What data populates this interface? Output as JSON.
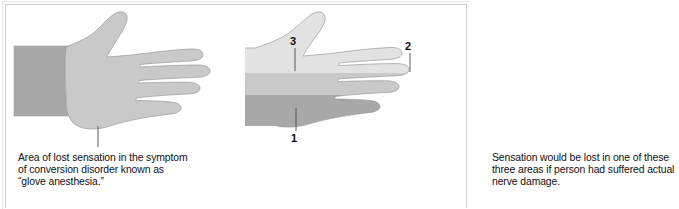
{
  "figure": {
    "background_color": "#ffffff",
    "frame_color": "#cfcfcf"
  },
  "palette": {
    "forearm_dark": "#a8a8a8",
    "hand_light": "#c9c9c9",
    "zone_light": "#e2e2e2",
    "zone_medium": "#c9c9c9",
    "zone_dark": "#a8a8a8",
    "outline": "#8e8e8e",
    "leader_line": "#4a4a4a",
    "text": "#111111"
  },
  "left_panel": {
    "name": "glove-anesthesia-diagram",
    "caption": "Area of lost sensation in the symptom\nof conversion disorder known as\n“glove anesthesia.”",
    "regions": [
      {
        "name": "forearm",
        "label": "forearm",
        "color": "#a8a8a8"
      },
      {
        "name": "glove-area",
        "label": "area of lost sensation",
        "color": "#c9c9c9"
      }
    ]
  },
  "right_panel": {
    "name": "nerve-damage-diagram",
    "caption": "Sensation would be lost in one of these\nthree areas if person had suffered actual\nnerve damage.",
    "zones": [
      {
        "id": "1",
        "label": "1",
        "name": "nerve-zone-1",
        "color": "#a8a8a8",
        "description": "lower forearm and lower fingers"
      },
      {
        "id": "2",
        "label": "2",
        "name": "nerve-zone-2",
        "color": "#c9c9c9",
        "description": "middle hand and upper fingers"
      },
      {
        "id": "3",
        "label": "3",
        "name": "nerve-zone-3",
        "color": "#e2e2e2",
        "description": "upper forearm and thumb"
      }
    ]
  }
}
